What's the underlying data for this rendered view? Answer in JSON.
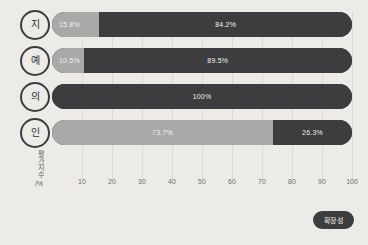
{
  "chart_data": {
    "type": "bar",
    "title": "",
    "subtitle": "",
    "orientation": "horizontal",
    "stacked": true,
    "normalized_percent": true,
    "categories": [
      "지",
      "예",
      "의",
      "인"
    ],
    "series": [
      {
        "name": "light",
        "values": [
          15.8,
          10.5,
          0,
          73.7
        ]
      },
      {
        "name": "dark",
        "values": [
          84.2,
          89.5,
          100,
          26.3
        ]
      }
    ],
    "rows": [
      {
        "label": "지",
        "segments": [
          {
            "kind": "light",
            "value": 15.8,
            "label": "15.8%",
            "color": "#a9a9a7"
          },
          {
            "kind": "dark",
            "value": 84.2,
            "label": "84.2%",
            "color": "#3d3d3f"
          }
        ]
      },
      {
        "label": "예",
        "segments": [
          {
            "kind": "light",
            "value": 10.5,
            "label": "10.5%",
            "color": "#a9a9a7"
          },
          {
            "kind": "dark",
            "value": 89.5,
            "label": "89.5%",
            "color": "#3d3d3f"
          }
        ]
      },
      {
        "label": "의",
        "segments": [
          {
            "kind": "dark",
            "value": 100,
            "label": "100%",
            "color": "#3d3d3f"
          }
        ]
      },
      {
        "label": "인",
        "segments": [
          {
            "kind": "light",
            "value": 73.7,
            "label": "73.7%",
            "color": "#a9a9a7"
          },
          {
            "kind": "dark",
            "value": 26.3,
            "label": "26.3%",
            "color": "#3d3d3f"
          }
        ]
      }
    ],
    "xlabel": "",
    "ylabel": "평가지수",
    "yunit": "%",
    "xticks": [
      10,
      20,
      30,
      40,
      50,
      60,
      70,
      80,
      90,
      100
    ],
    "xtick_labels": [
      "10",
      "20",
      "30",
      "40",
      "50",
      "60",
      "70",
      "80",
      "90",
      "100"
    ],
    "xlim": [
      0,
      100
    ],
    "grid": true,
    "grid_axis": "x",
    "legend": {
      "position": "bottom-right",
      "entries": [
        {
          "label": "확장성",
          "color": "#3d3d3f"
        }
      ]
    }
  },
  "colors": {
    "background": "#edebe7",
    "light_segment": "#a9a9a7",
    "dark_segment": "#3d3d3f",
    "gridline": "#dcdad5",
    "tick_text": "#6f6e6b",
    "segment_text": "#f2f1ee",
    "badge_background": "#3d3d3f",
    "badge_text": "#f4f3f0"
  }
}
